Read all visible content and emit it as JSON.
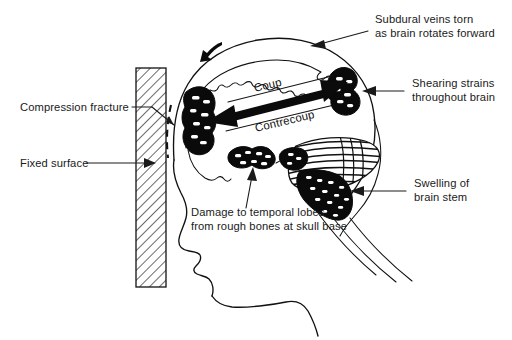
{
  "figure": {
    "background_color": "#ffffff",
    "ink_color": "#111111"
  },
  "labels": {
    "compression_fracture": "Compression fracture",
    "fixed_surface": "Fixed surface",
    "subdural_line1": "Subdural veins torn",
    "subdural_line2": "as brain rotates forward",
    "shearing_line1": "Shearing strains",
    "shearing_line2": "throughout brain",
    "swelling_line1": "Swelling of",
    "swelling_line2": "brain stem",
    "temporal_line1": "Damage to temporal lobes",
    "temporal_line2": "from rough bones at skull base",
    "coup": "Coup",
    "contrecoup": "Contrecoup"
  },
  "structures": {
    "wall": "hatched-fixed-surface-wall",
    "skull_outline": "head-and-skull-profile",
    "brain_outline": "brain-surface-outline",
    "coup_lesion": "anterior-contusion-blob",
    "contrecoup_lesion": "posterior-contusion-blob",
    "temporal_lesion": "temporal-lobe-contusion-blob",
    "brain_stem": "swollen-brain-stem",
    "cerebellum": "hatched-cerebellum",
    "spinal_cord": "spinal-cord-lines",
    "rotation_arrow": "brain-rotation-arrow",
    "coup_arrow": "coup-contrecoup-double-arrow"
  }
}
